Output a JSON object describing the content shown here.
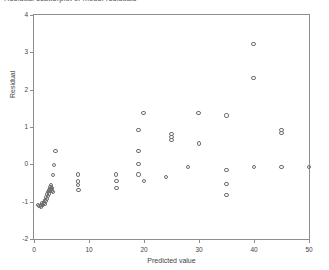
{
  "figure": {
    "caption_cropped": "Residual scatterplot of model residuals"
  },
  "axes": {
    "x_title": "Predicted value",
    "y_title": "Residual",
    "x_ticks": [
      "0",
      "10",
      "20",
      "30",
      "40",
      "50"
    ],
    "y_ticks": [
      "4",
      "3",
      "2",
      "1",
      "0",
      "-1",
      "-2"
    ]
  },
  "style": {
    "marker_stroke": "#6e6e6e",
    "frame_color": "#8d8d8d",
    "text_color": "#3f3f3f",
    "background": "#ffffff"
  },
  "chart_data": {
    "type": "scatter",
    "title": "",
    "xlabel": "Predicted value",
    "ylabel": "Residual",
    "xlim": [
      0,
      50
    ],
    "ylim": [
      -2,
      4
    ],
    "xticks": [
      0,
      10,
      20,
      30,
      40,
      50
    ],
    "yticks": [
      -2,
      -1,
      0,
      1,
      2,
      3,
      4
    ],
    "grid": false,
    "legend": null,
    "marker": "open-circle",
    "n_points": 60,
    "series": [
      {
        "name": "Residuals",
        "points": [
          [
            0.8,
            -1.1
          ],
          [
            1.0,
            -1.12
          ],
          [
            1.2,
            -1.08
          ],
          [
            1.3,
            -1.13
          ],
          [
            1.5,
            -1.05
          ],
          [
            1.6,
            -1.1
          ],
          [
            1.8,
            -1.02
          ],
          [
            1.9,
            -1.06
          ],
          [
            2.0,
            -0.95
          ],
          [
            2.1,
            -0.99
          ],
          [
            2.2,
            -0.88
          ],
          [
            2.3,
            -0.92
          ],
          [
            2.4,
            -0.8
          ],
          [
            2.5,
            -0.84
          ],
          [
            2.6,
            -0.74
          ],
          [
            2.7,
            -0.78
          ],
          [
            2.8,
            -0.7
          ],
          [
            2.9,
            -0.72
          ],
          [
            3.0,
            -0.66
          ],
          [
            3.0,
            -0.6
          ],
          [
            3.1,
            -0.56
          ],
          [
            3.2,
            -0.7
          ],
          [
            3.3,
            -0.63
          ],
          [
            3.5,
            -0.74
          ],
          [
            3.4,
            -0.28
          ],
          [
            3.6,
            -0.02
          ],
          [
            3.9,
            0.35
          ],
          [
            8.0,
            -0.27
          ],
          [
            8.0,
            -0.46
          ],
          [
            8.0,
            -0.56
          ],
          [
            8.1,
            -0.69
          ],
          [
            14.9,
            -0.27
          ],
          [
            15.0,
            -0.44
          ],
          [
            15.0,
            -0.63
          ],
          [
            19.0,
            0.93
          ],
          [
            19.0,
            0.36
          ],
          [
            19.0,
            0.01
          ],
          [
            19.0,
            -0.27
          ],
          [
            19.9,
            1.38
          ],
          [
            20.0,
            -0.45
          ],
          [
            24.0,
            -0.35
          ],
          [
            25.0,
            0.82
          ],
          [
            25.0,
            0.74
          ],
          [
            25.0,
            0.66
          ],
          [
            28.0,
            -0.08
          ],
          [
            29.9,
            1.38
          ],
          [
            30.0,
            0.56
          ],
          [
            35.0,
            1.31
          ],
          [
            35.0,
            -0.16
          ],
          [
            35.0,
            -0.53
          ],
          [
            35.0,
            -0.82
          ],
          [
            39.9,
            3.22
          ],
          [
            39.9,
            2.31
          ],
          [
            40.0,
            -0.08
          ],
          [
            45.0,
            0.92
          ],
          [
            45.0,
            0.85
          ],
          [
            45.0,
            -0.07
          ],
          [
            50.0,
            -0.08
          ]
        ]
      }
    ]
  }
}
